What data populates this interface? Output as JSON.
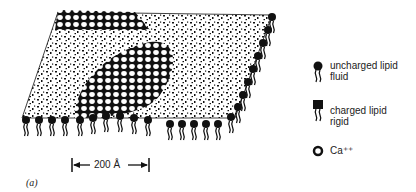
{
  "figure": {
    "panel_label": "(a)",
    "scale_bar": {
      "label": "200 Å",
      "value": 200,
      "unit": "Å"
    },
    "legend": [
      {
        "icon": "uncharged-lipid-icon",
        "label_line1": "uncharged lipid",
        "label_line2": "fluid"
      },
      {
        "icon": "charged-lipid-icon",
        "label_line1": "charged lipid",
        "label_line2": "rigid"
      },
      {
        "icon": "calcium-ion-icon",
        "label_line1": "Ca⁺⁺",
        "label_line2": ""
      }
    ],
    "colors": {
      "ink": "#111111",
      "background": "#ffffff"
    }
  }
}
